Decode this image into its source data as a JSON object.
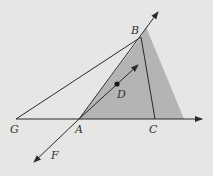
{
  "diagram": {
    "background": "#e6e6e4",
    "shade_color": "#b4b4b2",
    "line_color": "#2a2a2a",
    "points": {
      "G": {
        "label": "G",
        "x": 16,
        "y": 119
      },
      "A": {
        "label": "A",
        "x": 79,
        "y": 119
      },
      "C": {
        "label": "C",
        "x": 155,
        "y": 119
      },
      "B": {
        "label": "B",
        "x": 141,
        "y": 37
      },
      "D": {
        "label": "D",
        "x": 117,
        "y": 84
      },
      "F": {
        "label": "F",
        "x": 34,
        "y": 162
      }
    },
    "labels": {
      "G": "G",
      "A": "A",
      "C": "C",
      "B": "B",
      "D": "D",
      "F": "F"
    }
  }
}
